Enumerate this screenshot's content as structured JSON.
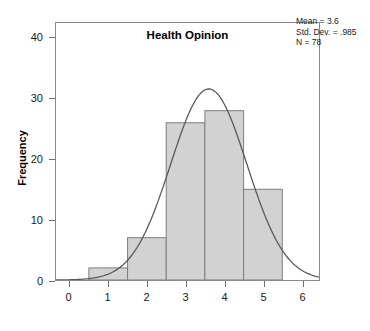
{
  "chart_data": {
    "type": "bar",
    "title": "",
    "subtitle": "",
    "xlabel": "Health Opinion",
    "ylabel": "Frequency",
    "categories": [
      "1",
      "2",
      "3",
      "4",
      "5"
    ],
    "values": [
      2,
      7,
      26,
      28,
      15
    ],
    "bin_centers": [
      1,
      2,
      3,
      4,
      5
    ],
    "bin_width": 1,
    "bin_edges": [
      0.5,
      1.5,
      2.5,
      3.5,
      4.5,
      5.5
    ],
    "xlim": [
      -0.35,
      6.45
    ],
    "ylim": [
      0,
      42.5
    ],
    "xticks": [
      "0",
      "1",
      "2",
      "3",
      "4",
      "5",
      "6"
    ],
    "xtick_values": [
      0,
      1,
      2,
      3,
      4,
      5,
      6
    ],
    "yticks": [
      "0",
      "10",
      "20",
      "30",
      "40"
    ],
    "ytick_values": [
      0,
      10,
      20,
      30,
      40
    ],
    "grid": false,
    "legend": "none",
    "bar_color": "#d2d2d2",
    "bar_edge_color": "#7d7d7d",
    "overlay": {
      "type": "normal-curve",
      "label": "Normal distribution curve",
      "mean": 3.6,
      "std_dev": 0.985,
      "n": 78,
      "peak_value": 31.6,
      "color": "#5a5a5a"
    },
    "annotations": {
      "mean_line": "Mean = 3.6",
      "std_dev_line": "Std. Dev. = .985",
      "n_line": "N = 78"
    }
  },
  "stats": {
    "mean": "Mean = 3.6",
    "std_dev": "Std. Dev. = .985",
    "n": "N = 78"
  },
  "axes": {
    "x_title": "Health Opinion",
    "y_title": "Frequency"
  }
}
